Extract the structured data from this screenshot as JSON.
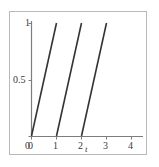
{
  "figure": {
    "background_color": "#ffffff",
    "border_color": "#b9b9b9",
    "axis_color": "#7d7d7d",
    "curve_color": "#333333"
  },
  "chart_data": {
    "type": "line",
    "title": "",
    "subtitle": "",
    "xlabel": "t",
    "ylabel": "",
    "xlim": [
      -0.18,
      4.6
    ],
    "ylim": [
      -0.06,
      1.08
    ],
    "grid": false,
    "legend": null,
    "x_ticks": [
      0,
      1,
      2,
      3,
      4
    ],
    "x_tick_labels": [
      "0",
      "1",
      "2",
      "3",
      "4"
    ],
    "y_ticks": [
      0,
      0.5,
      1
    ],
    "y_tick_labels": [
      "0",
      "0.5",
      "1"
    ],
    "annotations": [],
    "series": [
      {
        "name": "sawtooth-ramp-1",
        "x": [
          0,
          1
        ],
        "y": [
          0,
          1
        ]
      },
      {
        "name": "sawtooth-ramp-2",
        "x": [
          1,
          2
        ],
        "y": [
          0,
          1
        ]
      },
      {
        "name": "sawtooth-ramp-3",
        "x": [
          2,
          3
        ],
        "y": [
          0,
          1
        ]
      }
    ]
  },
  "axes": {
    "x_axis_name": "x-axis",
    "y_axis_name": "y-axis",
    "x_tick_0": "0",
    "x_tick_1": "1",
    "x_tick_2": "2",
    "x_tick_3": "3",
    "x_tick_4": "4",
    "y_tick_0": "0",
    "y_tick_half": "0.5",
    "y_tick_1": "1",
    "x_variable": "t"
  }
}
